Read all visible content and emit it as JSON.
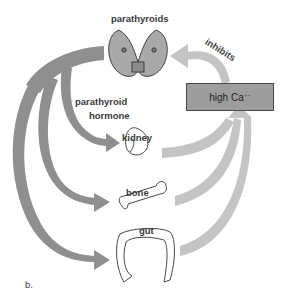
{
  "diagram": {
    "labels": {
      "parathyroids": "parathyroids",
      "hormone_line1": "parathyroid",
      "hormone_line2": "hormone",
      "kidney": "kidney",
      "bone": "bone",
      "gut": "gut",
      "inhibits": "inhibits",
      "panel": "b."
    },
    "box": {
      "text": "high Ca",
      "superscript": "++"
    },
    "colors": {
      "hormone_arrows": "#8f8f8f",
      "feedback_arrows": "#c4c4c4",
      "box_fill": "#9d9d9d",
      "box_border": "#4a4a4a"
    }
  }
}
